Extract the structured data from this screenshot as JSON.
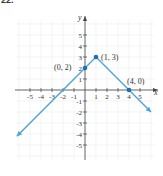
{
  "problem": {
    "number": "22."
  },
  "chart_data": {
    "type": "line",
    "title": "",
    "xlabel": "x",
    "ylabel": "y",
    "xlim": [
      -6,
      6
    ],
    "ylim": [
      -6,
      6
    ],
    "grid": true,
    "x_ticks": [
      -5,
      -4,
      -3,
      -2,
      -1,
      1,
      2,
      3,
      4,
      5
    ],
    "y_ticks": [
      -5,
      -4,
      -3,
      -2,
      -1,
      1,
      2,
      3,
      4,
      5
    ],
    "x_tick_labels": [
      "-5",
      "-4",
      "-3",
      "-2",
      "-1",
      "1",
      "2",
      "3",
      "4",
      "5"
    ],
    "y_tick_labels": [
      "-5",
      "-4",
      "-3",
      "-2",
      "-1",
      "1",
      "2",
      "3",
      "4",
      "5"
    ],
    "series": [
      {
        "name": "piecewise linear (y = -|x - 1| + 3)",
        "color": "#4aa3d8",
        "x": [
          -6.2,
          0,
          1,
          4,
          6
        ],
        "y": [
          -4.2,
          2,
          3,
          0,
          -2
        ],
        "arrows": "both ends"
      }
    ],
    "annotations": [
      {
        "label": "(0, 2)",
        "x": 0,
        "y": 2
      },
      {
        "label": "(1, 3)",
        "x": 1,
        "y": 3
      },
      {
        "label": "(4, 0)",
        "x": 4,
        "y": 0
      }
    ],
    "point_color": "#1f6fa8"
  },
  "labels": {
    "axis_x": "x",
    "axis_y": "y",
    "pt1": "(0, 2)",
    "pt2": "(1, 3)",
    "pt3": "(4, 0)"
  }
}
